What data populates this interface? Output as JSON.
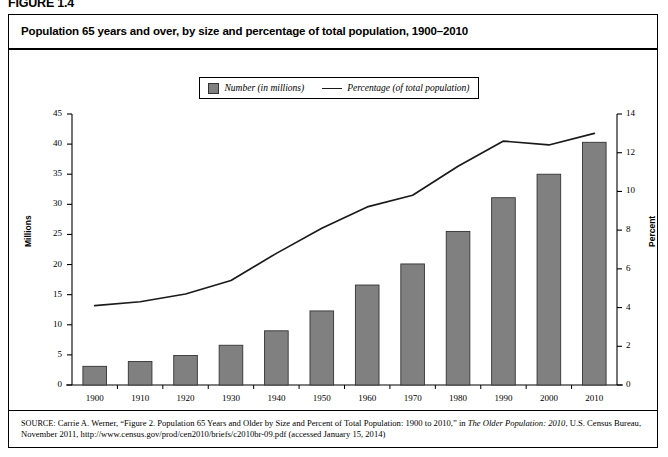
{
  "figure": {
    "label": "FIGURE 1.4",
    "title": "Population 65 years and over, by size and percentage of total population, 1900–2010"
  },
  "legend": {
    "bar_label": "Number (in millions)",
    "line_label": "Percentage (of total population)"
  },
  "axes": {
    "left_title": "Millions",
    "right_title": "Percent"
  },
  "source": {
    "prefix": "SOURCE:",
    "text_part1": " Carrie A. Werner, “Figure 2. Population 65 Years and Older by Size and Percent of Total Population: 1900 to 2010,” in ",
    "italic1": "The Older Population: 2010",
    "text_part2": ", U.S. Census Bureau, November 2011, http://www.census.gov/prod/cen2010/briefs/c2010br-09.pdf (accessed January 15, 2014)"
  },
  "colors": {
    "bar_fill": "#808080",
    "bar_stroke": "#333333",
    "line": "#1a1a1a",
    "axis": "#000000",
    "background": "#ffffff"
  },
  "chart_data": {
    "type": "bar",
    "title": "Population 65 years and over, by size and percentage of total population, 1900–2010",
    "xlabel": "",
    "ylabel": "Millions",
    "y2label": "Percent",
    "categories": [
      "1900",
      "1910",
      "1920",
      "1930",
      "1940",
      "1950",
      "1960",
      "1970",
      "1980",
      "1990",
      "2000",
      "2010"
    ],
    "ylim": [
      0,
      45
    ],
    "y2lim": [
      0,
      14
    ],
    "yticks": [
      0,
      5,
      10,
      15,
      20,
      25,
      30,
      35,
      40,
      45
    ],
    "y2ticks": [
      0,
      2,
      4,
      6,
      8,
      10,
      12,
      14
    ],
    "grid": false,
    "legend_position": "top-center",
    "series": [
      {
        "name": "Number (in millions)",
        "type": "bar",
        "axis": "left",
        "values": [
          3.1,
          3.9,
          4.9,
          6.6,
          9.0,
          12.3,
          16.6,
          20.1,
          25.5,
          31.1,
          35.0,
          40.3
        ]
      },
      {
        "name": "Percentage (of total population)",
        "type": "line",
        "axis": "right",
        "values": [
          4.1,
          4.3,
          4.7,
          5.4,
          6.8,
          8.1,
          9.2,
          9.8,
          11.3,
          12.6,
          12.4,
          13.0
        ]
      }
    ]
  }
}
